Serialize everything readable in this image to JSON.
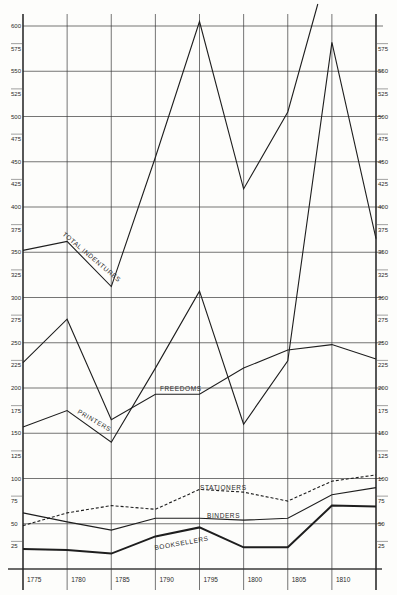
{
  "chart_data": {
    "type": "line",
    "title": "",
    "xlabel": "",
    "ylabel": "",
    "x": [
      1775,
      1780,
      1785,
      1790,
      1795,
      1800,
      1805,
      1810,
      1815
    ],
    "x_tick_labels": [
      "1775",
      "1780",
      "1785",
      "1790",
      "1795",
      "1800",
      "1805",
      "1810"
    ],
    "ylim": [
      0,
      600
    ],
    "y_ticks_left": [
      25,
      50,
      75,
      100,
      125,
      150,
      175,
      200,
      225,
      250,
      275,
      300,
      325,
      350,
      375,
      400,
      425,
      450,
      475,
      500,
      525,
      550,
      575,
      600
    ],
    "y_ticks_right": [
      25,
      50,
      75,
      100,
      125,
      150,
      175,
      200,
      225,
      250,
      275,
      300,
      325,
      350,
      375,
      400,
      425,
      450,
      475,
      500,
      525,
      550,
      575
    ],
    "grid": true,
    "legend_position": "inline labels",
    "series": [
      {
        "name": "TOTAL INDENTURES",
        "style": "solid",
        "values": [
          352,
          362,
          312,
          455,
          605,
          420,
          505,
          680,
          null
        ]
      },
      {
        "name": "PRINTERS",
        "style": "solid",
        "values": [
          157,
          175,
          140,
          222,
          307,
          160,
          230,
          582,
          365
        ]
      },
      {
        "name": "FREEDOMS",
        "style": "solid",
        "values": [
          228,
          276,
          165,
          193,
          193,
          222,
          242,
          248,
          232
        ]
      },
      {
        "name": "STATIONERS",
        "style": "dashed",
        "values": [
          48,
          62,
          70,
          66,
          88,
          85,
          75,
          97,
          104
        ]
      },
      {
        "name": "BINDERS",
        "style": "solid",
        "values": [
          62,
          52,
          43,
          56,
          56,
          54,
          56,
          82,
          90
        ]
      },
      {
        "name": "BOOKSELLERS",
        "style": "bold",
        "values": [
          22,
          21,
          17,
          36,
          46,
          24,
          24,
          70,
          69
        ]
      }
    ]
  },
  "labels": {
    "total_indentures": "TOTAL INDENTURES",
    "printers": "PRINTERS",
    "freedoms": "FREEDOMS",
    "stationers": "STATIONERS",
    "binders": "BINDERS",
    "booksellers": "BOOKSELLERS"
  }
}
